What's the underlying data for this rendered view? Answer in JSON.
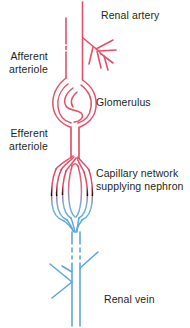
{
  "figure": {
    "background_color": "#ffffff",
    "width": 190,
    "height": 328
  },
  "colors": {
    "arterial_red": "#e4506a",
    "arterial_red_light": "#ea7f93",
    "venous_blue": "#5fa8d8",
    "venous_blue_light": "#8fc4e4",
    "text": "#231f20"
  },
  "labels": {
    "renal_artery": "Renal artery",
    "afferent_arteriole": "Afferent\narteriole",
    "glomerulus": "Glomerulus",
    "efferent_arteriole": "Efferent\narteriole",
    "capillary_network": "Capillary network\nsupplying nephron",
    "renal_vein": "Renal vein"
  },
  "structures": [
    {
      "name": "renal-artery",
      "label": "Renal artery",
      "flow": "arterial",
      "color": "#e4506a",
      "description": "Main arterial trunk entering at top with side branches"
    },
    {
      "name": "afferent-arteriole",
      "label": "Afferent arteriole",
      "flow": "arterial",
      "color": "#e4506a",
      "description": "Vessel carrying blood into the glomerulus"
    },
    {
      "name": "glomerulus",
      "label": "Glomerulus",
      "flow": "arterial",
      "color": "#e4506a",
      "description": "Coiled capillary tuft within Bowman's capsule"
    },
    {
      "name": "efferent-arteriole",
      "label": "Efferent arteriole",
      "flow": "arterial",
      "color": "#e4506a",
      "description": "Vessel carrying blood away from the glomerulus"
    },
    {
      "name": "capillary-network",
      "label": "Capillary network supplying nephron",
      "flow": "arterial-to-venous",
      "color": "#e4506a",
      "color_end": "#5fa8d8",
      "description": "Peritubular capillary loops where red arterial blood grades into blue venous blood"
    },
    {
      "name": "renal-vein",
      "label": "Renal vein",
      "flow": "venous",
      "color": "#5fa8d8",
      "description": "Main venous trunk leaving at bottom with side branches"
    }
  ]
}
